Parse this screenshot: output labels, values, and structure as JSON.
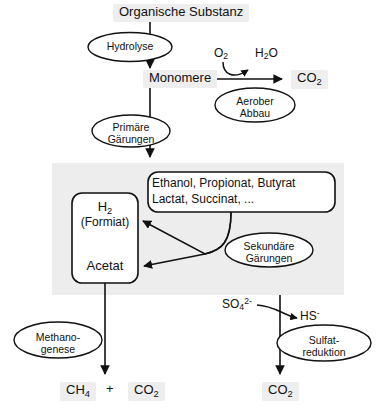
{
  "diagram": {
    "title_node": "Organische Substanz",
    "nodes": {
      "monomere": "Monomere",
      "o2": "O2",
      "h2o": "H2O",
      "co2_aerob": "CO2",
      "h2": "H2",
      "formiat": "(Formiat)",
      "acetat": "Acetat",
      "fermentation_products_line1": "Ethanol,  Propionat,  Butyrat",
      "fermentation_products_line2": "Lactat,  Succinat,  ...",
      "so4": "SO4",
      "so4_charge": "2-",
      "hs": "HS",
      "hs_charge": "-",
      "ch4": "CH4",
      "plus": "+",
      "co2_methano": "CO2",
      "co2_sulfat": "CO2"
    },
    "processes": {
      "hydrolyse": "Hydrolyse",
      "aerober_abbau_line1": "Aerober",
      "aerober_abbau_line2": "Abbau",
      "primaere_gaerungen_line1": "Primäre",
      "primaere_gaerungen_line2": "Gärungen",
      "sekundaere_gaerungen_line1": "Sekundäre",
      "sekundaere_gaerungen_line2": "Gärungen",
      "methanogenese_line1": "Methano-",
      "methanogenese_line2": "genese",
      "sulfatreduktion_line1": "Sulfat-",
      "sulfatreduktion_line2": "reduktion"
    },
    "colors": {
      "stroke": "#111111",
      "text": "#111111",
      "panel_fill": "#ededed",
      "label_highlight": "#eeeeee",
      "background": "#ffffff"
    }
  }
}
